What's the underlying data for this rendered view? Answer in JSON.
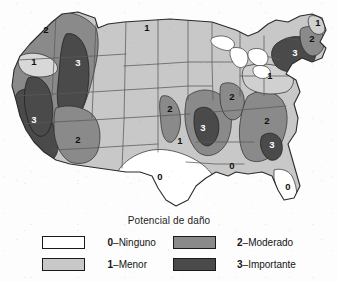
{
  "figure": {
    "kind": "seismic-hazard-choropleth-map",
    "region": "Estados Unidos"
  },
  "legend": {
    "title": "Potencial de daño",
    "entries": [
      {
        "level": "0",
        "separator": "–",
        "label": "Ninguno",
        "color": "#ffffff",
        "text_on_fill": "dark"
      },
      {
        "level": "1",
        "separator": "–",
        "label": "Menor",
        "color": "#c8c8c8",
        "text_on_fill": "dark"
      },
      {
        "level": "2",
        "separator": "–",
        "label": "Moderado",
        "color": "#8a8a8a",
        "text_on_fill": "dark"
      },
      {
        "level": "3",
        "separator": "–",
        "label": "Importante",
        "color": "#4a4a4a",
        "text_on_fill": "light"
      }
    ]
  },
  "map": {
    "colors": {
      "level0": "#ffffff",
      "level1": "#c8c8c8",
      "level2": "#8a8a8a",
      "level3": "#4a4a4a",
      "state_border": "#5a5a5a",
      "zone_border": "#2a2a2a",
      "coastline": "#3a3a3a"
    },
    "zone_labels": [
      {
        "id": "pacific-northwest-2",
        "value": "2",
        "x": 46,
        "y": 33,
        "tone": "dark"
      },
      {
        "id": "puget-lowland-1",
        "value": "1",
        "x": 34,
        "y": 65,
        "tone": "dark"
      },
      {
        "id": "cascadia-3",
        "value": "3",
        "x": 78,
        "y": 66,
        "tone": "light"
      },
      {
        "id": "california-3",
        "value": "3",
        "x": 34,
        "y": 123,
        "tone": "light"
      },
      {
        "id": "arizona-nevada-2",
        "value": "2",
        "x": 78,
        "y": 143,
        "tone": "dark"
      },
      {
        "id": "northern-plains-1",
        "value": "1",
        "x": 147,
        "y": 31,
        "tone": "dark"
      },
      {
        "id": "central-plains-2",
        "value": "2",
        "x": 170,
        "y": 112,
        "tone": "dark"
      },
      {
        "id": "southern-plains-1",
        "value": "1",
        "x": 180,
        "y": 144,
        "tone": "dark"
      },
      {
        "id": "texas-0",
        "value": "0",
        "x": 160,
        "y": 180,
        "tone": "dark"
      },
      {
        "id": "new-madrid-3",
        "value": "3",
        "x": 203,
        "y": 131,
        "tone": "light"
      },
      {
        "id": "gulf-coast-0",
        "value": "0",
        "x": 232,
        "y": 169,
        "tone": "dark"
      },
      {
        "id": "great-lakes-2",
        "value": "2",
        "x": 232,
        "y": 100,
        "tone": "dark"
      },
      {
        "id": "appalachian-2",
        "value": "2",
        "x": 267,
        "y": 124,
        "tone": "dark"
      },
      {
        "id": "charleston-3",
        "value": "3",
        "x": 272,
        "y": 148,
        "tone": "light"
      },
      {
        "id": "florida-0",
        "value": "0",
        "x": 288,
        "y": 190,
        "tone": "dark"
      },
      {
        "id": "mid-atlantic-1",
        "value": "1",
        "x": 270,
        "y": 79,
        "tone": "dark"
      },
      {
        "id": "new-england-3",
        "value": "3",
        "x": 295,
        "y": 56,
        "tone": "light"
      },
      {
        "id": "coastal-maine-2",
        "value": "2",
        "x": 312,
        "y": 42,
        "tone": "dark"
      },
      {
        "id": "northern-maine-1",
        "value": "1",
        "x": 318,
        "y": 26,
        "tone": "dark"
      }
    ]
  }
}
